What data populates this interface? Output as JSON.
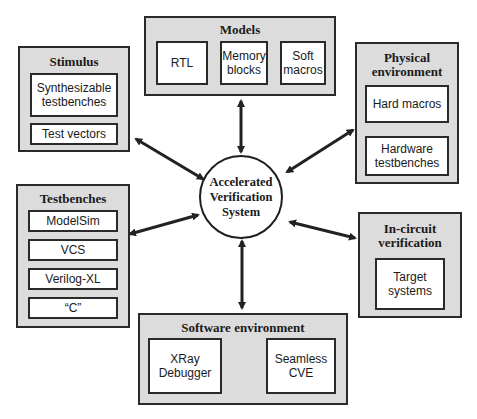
{
  "center": {
    "line1": "Accelerated",
    "line2": "Verification",
    "line3": "System"
  },
  "groups": {
    "models": {
      "title": "Models",
      "items": [
        {
          "line1": "RTL",
          "line2": ""
        },
        {
          "line1": "Memory",
          "line2": "blocks"
        },
        {
          "line1": "Soft",
          "line2": "macros"
        }
      ]
    },
    "stimulus": {
      "title": "Stimulus",
      "items": [
        {
          "line1": "Synthesizable",
          "line2": "testbenches"
        },
        {
          "line1": "Test vectors",
          "line2": ""
        }
      ]
    },
    "physical": {
      "title_line1": "Physical",
      "title_line2": "environment",
      "items": [
        {
          "line1": "Hard macros",
          "line2": ""
        },
        {
          "line1": "Hardware",
          "line2": "testbenches"
        }
      ]
    },
    "testbenches": {
      "title": "Testbenches",
      "items": [
        {
          "label": "ModelSim"
        },
        {
          "label": "VCS"
        },
        {
          "label": "Verilog-XL"
        },
        {
          "label": "“C”"
        }
      ]
    },
    "incircuit": {
      "title_line1": "In-circuit",
      "title_line2": "verification",
      "items": [
        {
          "line1": "Target",
          "line2": "systems"
        }
      ]
    },
    "software": {
      "title": "Software environment",
      "items": [
        {
          "line1": "XRay",
          "line2": "Debugger"
        },
        {
          "line1": "Seamless",
          "line2": "CVE"
        }
      ]
    }
  },
  "colors": {
    "group_fill": "#dcdcdc",
    "stroke": "#2a2a2a",
    "item_fill": "#ffffff"
  }
}
